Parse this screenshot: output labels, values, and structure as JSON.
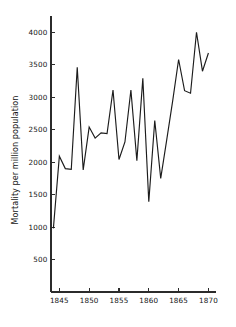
{
  "chart_data": {
    "type": "line",
    "title": "",
    "subtitle": "",
    "xlabel": "",
    "ylabel": "Mortality per million population",
    "xlim": [
      1843.6,
      1870.6
    ],
    "ylim": [
      0,
      4250
    ],
    "grid": false,
    "legend": null,
    "xticks": [
      1845,
      1850,
      1855,
      1860,
      1865,
      1870
    ],
    "xtick_labels": [
      "1845",
      "1850",
      "1855",
      "1860",
      "1865",
      "1870"
    ],
    "yticks": [
      500,
      1000,
      1500,
      2000,
      2500,
      3000,
      3500,
      4000
    ],
    "ytick_labels": [
      "500",
      "1000",
      "1500",
      "2000",
      "2500",
      "3000",
      "3500",
      "4000"
    ],
    "line_color": "#1c1c1c",
    "x": [
      1844,
      1845,
      1846,
      1847,
      1848,
      1849,
      1850,
      1851,
      1852,
      1853,
      1854,
      1855,
      1856,
      1857,
      1858,
      1859,
      1860,
      1861,
      1862,
      1863,
      1864,
      1865,
      1866,
      1867,
      1868,
      1869,
      1870
    ],
    "values": [
      980,
      2090,
      1900,
      1890,
      3460,
      1880,
      2540,
      2370,
      2450,
      2440,
      3110,
      2040,
      2310,
      3110,
      2020,
      3290,
      1390,
      2640,
      1750,
      2340,
      2940,
      3580,
      3100,
      3060,
      4000,
      3400,
      3680
    ],
    "series": [
      {
        "name": "Mortality per million population",
        "values": [
          980,
          2090,
          1900,
          1890,
          3460,
          1880,
          2540,
          2370,
          2450,
          2440,
          3110,
          2040,
          2310,
          3110,
          2020,
          3290,
          1390,
          2640,
          1750,
          2340,
          2940,
          3580,
          3100,
          3060,
          4000,
          3400,
          3680
        ]
      }
    ]
  }
}
